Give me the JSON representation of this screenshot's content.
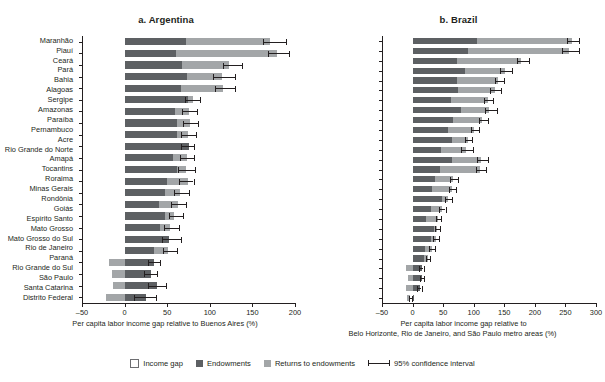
{
  "chart_data": [
    {
      "type": "bar",
      "orientation": "horizontal",
      "title": "a. Argentina",
      "xlabel": "Per capita labor income gap relative to Buenos Aires (%)",
      "ylabel": "",
      "xlim": [
        -50,
        200
      ],
      "xticks": [
        -50,
        0,
        50,
        100,
        150,
        200
      ],
      "grid": false,
      "legend_position": "bottom-center",
      "categories": [
        "Chaco",
        "Corrientes",
        "Misiones",
        "Santiago del Estero",
        "Formosa",
        "Salta",
        "Jujuy",
        "Catamarca",
        "Tucumán",
        "Buenos Aires",
        "Córdoba",
        "San Juan",
        "Entre Ríos",
        "Mendoza",
        "La Rioja",
        "San Luis",
        "Santa Fe",
        "La Pampa",
        "Río Negro",
        "Chubut",
        "Neuquén",
        "Santa Cruz",
        "Tierra del Fuego"
      ],
      "series": [
        {
          "name": "Endowments",
          "values": [
            72,
            60,
            67,
            73,
            66,
            74,
            59,
            62,
            62,
            75,
            57,
            62,
            50,
            48,
            40,
            48,
            42,
            52,
            35,
            -18,
            -15,
            -14,
            -22
          ]
        },
        {
          "name": "Returns to endowments",
          "values": [
            99,
            118,
            55,
            41,
            49,
            6,
            16,
            15,
            13,
            -1,
            16,
            10,
            25,
            18,
            22,
            11,
            12,
            -1,
            17,
            52,
            45,
            51,
            47
          ]
        }
      ],
      "totals": [
        171,
        178,
        122,
        114,
        115,
        80,
        75,
        77,
        75,
        74,
        73,
        72,
        75,
        66,
        62,
        59,
        54,
        51,
        52,
        34,
        30,
        37,
        25
      ],
      "ci_low": [
        163,
        168,
        115,
        104,
        106,
        71,
        67,
        68,
        66,
        66,
        65,
        63,
        64,
        58,
        54,
        52,
        46,
        44,
        45,
        27,
        23,
        27,
        11
      ],
      "ci_high": [
        190,
        193,
        138,
        130,
        130,
        89,
        85,
        86,
        84,
        82,
        82,
        83,
        81,
        76,
        72,
        69,
        64,
        66,
        62,
        41,
        38,
        49,
        37
      ]
    },
    {
      "type": "bar",
      "orientation": "horizontal",
      "title": "b. Brazil",
      "xlabel": "Per capita labor income gap relative to",
      "xlabel_line2": "Belo Horizonte, Rio de Janeiro, and São Paulo metro areas (%)",
      "ylabel": "",
      "xlim": [
        -50,
        300
      ],
      "xticks": [
        -50,
        0,
        50,
        100,
        150,
        200,
        250,
        300
      ],
      "grid": false,
      "legend_position": "bottom-center",
      "categories": [
        "Maranhão",
        "Piauí",
        "Ceará",
        "Pará",
        "Bahia",
        "Alagoas",
        "Sergipe",
        "Amazonas",
        "Paraíba",
        "Pernambuco",
        "Acre",
        "Rio Grande do Norte",
        "Amapá",
        "Tocantins",
        "Roraima",
        "Minas Gerais",
        "Rondônia",
        "Goiás",
        "Espírito Santo",
        "Mato Grosso",
        "Mato Grosso do Sul",
        "Rio de Janeiro",
        "Paraná",
        "Rio Grande do Sul",
        "São Paulo",
        "Santa Catarina",
        "Distrito Federal"
      ],
      "series": [
        {
          "name": "Endowments",
          "values": [
            105,
            90,
            73,
            85,
            73,
            74,
            63,
            80,
            66,
            58,
            64,
            47,
            65,
            45,
            37,
            32,
            48,
            30,
            22,
            35,
            30,
            20,
            18,
            -10,
            -8,
            -11,
            -9
          ]
        },
        {
          "name": "Returns to endowments",
          "values": [
            155,
            165,
            105,
            65,
            67,
            60,
            60,
            45,
            48,
            42,
            26,
            41,
            47,
            65,
            30,
            32,
            10,
            18,
            20,
            5,
            8,
            11,
            7,
            24,
            23,
            22,
            5
          ]
        }
      ],
      "totals": [
        260,
        255,
        178,
        150,
        140,
        134,
        123,
        125,
        114,
        100,
        90,
        88,
        112,
        110,
        67,
        64,
        58,
        48,
        42,
        40,
        38,
        31,
        25,
        14,
        15,
        11,
        -4
      ],
      "ci_low": [
        252,
        245,
        171,
        143,
        134,
        127,
        117,
        118,
        109,
        95,
        85,
        80,
        105,
        104,
        61,
        59,
        53,
        44,
        38,
        36,
        34,
        27,
        22,
        11,
        12,
        8,
        -6
      ],
      "ci_high": [
        272,
        272,
        190,
        162,
        150,
        145,
        132,
        138,
        123,
        109,
        98,
        99,
        123,
        120,
        75,
        71,
        65,
        54,
        47,
        45,
        43,
        36,
        29,
        18,
        19,
        15,
        -1
      ]
    }
  ],
  "legend": {
    "items": [
      {
        "label": "Income gap",
        "swatch": "income-gap-swatch",
        "color": "#ffffff"
      },
      {
        "label": "Endowments",
        "swatch": "endowments-swatch",
        "color": "#5d6063"
      },
      {
        "label": "Returns to endowments",
        "swatch": "returns-swatch",
        "color": "#a3a6a8"
      },
      {
        "label": "95% confidence interval",
        "swatch": "ci-swatch",
        "color": "#231f20"
      }
    ]
  }
}
